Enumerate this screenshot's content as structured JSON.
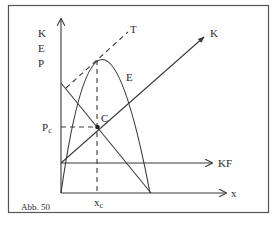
{
  "figure": {
    "caption": "Abb. 50",
    "y_axis_labels": [
      "K",
      "E",
      "P"
    ],
    "x_axis_label": "x",
    "curves": {
      "total_cost": "K",
      "revenue": "E",
      "tangent": "T",
      "fixed_cost": "KF"
    },
    "point": {
      "label": "C",
      "price_label": "P",
      "price_subscript": "c",
      "quantity_label": "x",
      "quantity_subscript": "c"
    },
    "colors": {
      "line": "#3a3a3a",
      "frame": "#555555",
      "background": "#ffffff"
    }
  }
}
